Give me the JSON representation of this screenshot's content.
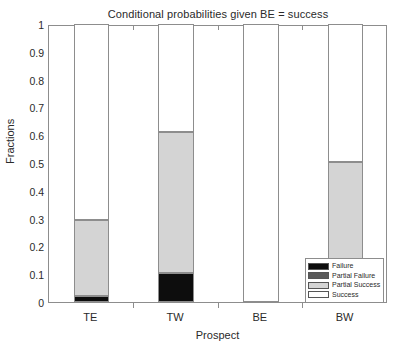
{
  "chart_data": {
    "type": "bar",
    "stacked": true,
    "title": "Conditional probabilities given BE = success",
    "xlabel": "Prospect",
    "ylabel": "Fractions",
    "categories": [
      "TE",
      "TW",
      "BE",
      "BW"
    ],
    "ylim": [
      0,
      1
    ],
    "yticks": [
      "0",
      "0.1",
      "0.2",
      "0.3",
      "0.4",
      "0.5",
      "0.6",
      "0.7",
      "0.8",
      "0.9",
      "1"
    ],
    "ytick_values": [
      0,
      0.1,
      0.2,
      0.3,
      0.4,
      0.5,
      0.6,
      0.7,
      0.8,
      0.9,
      1
    ],
    "grid": false,
    "legend_position": "inside-lower-right",
    "series": [
      {
        "name": "Failure",
        "color": "#0d0d0d",
        "values": [
          0.02,
          0.105,
          0.0,
          0.0
        ]
      },
      {
        "name": "Partial Failure",
        "color": "#5a5a5a",
        "values": [
          0.0,
          0.0,
          0.0,
          0.0
        ]
      },
      {
        "name": "Partial Success",
        "color": "#d4d4d4",
        "values": [
          0.275,
          0.505,
          0.0,
          0.505
        ]
      },
      {
        "name": "Success",
        "color": "#ffffff",
        "values": [
          0.705,
          0.39,
          1.0,
          0.495
        ]
      }
    ],
    "segment_tops": {
      "TE": [
        0.02,
        0.02,
        0.295,
        1.0
      ],
      "TW": [
        0.105,
        0.105,
        0.61,
        1.0
      ],
      "BE": [
        0.0,
        0.0,
        0.0,
        1.0
      ],
      "BW": [
        0.0,
        0.0,
        0.505,
        1.0
      ]
    }
  },
  "legend": {
    "items": [
      {
        "label": "Failure",
        "color": "#0d0d0d"
      },
      {
        "label": "Partial Failure",
        "color": "#5a5a5a"
      },
      {
        "label": "Partial Success",
        "color": "#d4d4d4"
      },
      {
        "label": "Success",
        "color": "#ffffff"
      }
    ]
  },
  "style": {
    "axis_color": "#8d8d8d",
    "text_color": "#2a2a2a",
    "background": "#ffffff"
  }
}
